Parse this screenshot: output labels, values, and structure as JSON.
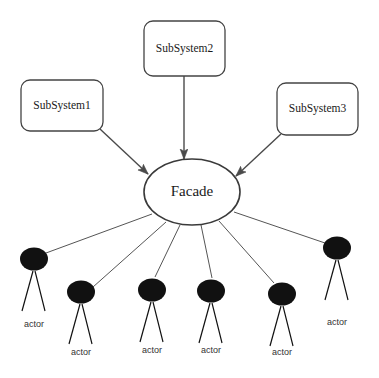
{
  "diagram": {
    "type": "uml-facade",
    "canvas": {
      "width": 379,
      "height": 378,
      "background": "#ffffff"
    },
    "colors": {
      "box_stroke": "#444444",
      "box_fill": "#ffffff",
      "ellipse_stroke": "#3a3a3a",
      "ellipse_fill": "#ffffff",
      "arrow": "#4a4a4a",
      "association": "#555555",
      "actor": "#111111",
      "text": "#1a1a1a"
    },
    "subsystems": [
      {
        "id": "subsystem1",
        "label": "SubSystem1",
        "x": 21,
        "y": 80,
        "w": 82,
        "h": 51
      },
      {
        "id": "subsystem2",
        "label": "SubSystem2",
        "x": 144,
        "y": 21,
        "w": 81,
        "h": 55
      },
      {
        "id": "subsystem3",
        "label": "SubSystem3",
        "x": 277,
        "y": 83,
        "w": 81,
        "h": 52
      }
    ],
    "facade": {
      "id": "facade",
      "label": "Facade",
      "cx": 192,
      "cy": 192,
      "rx": 48,
      "ry": 33
    },
    "actors": [
      {
        "id": "actor1",
        "label": "actor",
        "cx": 34,
        "cy": 259,
        "r": 13,
        "label_y": 325
      },
      {
        "id": "actor2",
        "label": "actor",
        "cx": 81,
        "cy": 292,
        "r": 13,
        "label_y": 353
      },
      {
        "id": "actor3",
        "label": "actor",
        "cx": 152,
        "cy": 290,
        "r": 13,
        "label_y": 351
      },
      {
        "id": "actor4",
        "label": "actor",
        "cx": 211,
        "cy": 291,
        "r": 13,
        "label_y": 351
      },
      {
        "id": "actor5",
        "label": "actor",
        "cx": 282,
        "cy": 294,
        "r": 13,
        "label_y": 353
      },
      {
        "id": "actor6",
        "label": "actor",
        "cx": 337,
        "cy": 248,
        "r": 13,
        "label_y": 323
      }
    ],
    "arrows": [
      {
        "id": "arrow-subsystem1-facade",
        "from": "subsystem1",
        "to": "facade",
        "x1": 100,
        "y1": 129,
        "x2": 148,
        "y2": 174
      },
      {
        "id": "arrow-subsystem2-facade",
        "from": "subsystem2",
        "to": "facade",
        "x1": 184,
        "y1": 76,
        "x2": 184,
        "y2": 159
      },
      {
        "id": "arrow-subsystem3-facade",
        "from": "subsystem3",
        "to": "facade",
        "x1": 281,
        "y1": 134,
        "x2": 236,
        "y2": 176
      }
    ],
    "associations": [
      {
        "id": "assoc-facade-actor1",
        "from": "facade",
        "to": "actor1",
        "x1": 152,
        "y1": 214,
        "x2": 46,
        "y2": 253
      },
      {
        "id": "assoc-facade-actor2",
        "from": "facade",
        "to": "actor2",
        "x1": 166,
        "y1": 222,
        "x2": 93,
        "y2": 287
      },
      {
        "id": "assoc-facade-actor3",
        "from": "facade",
        "to": "actor3",
        "x1": 180,
        "y1": 225,
        "x2": 155,
        "y2": 277
      },
      {
        "id": "assoc-facade-actor4",
        "from": "facade",
        "to": "actor4",
        "x1": 201,
        "y1": 225,
        "x2": 212,
        "y2": 278
      },
      {
        "id": "assoc-facade-actor5",
        "from": "facade",
        "to": "actor5",
        "x1": 219,
        "y1": 221,
        "x2": 274,
        "y2": 283
      },
      {
        "id": "assoc-facade-actor6",
        "from": "facade",
        "to": "actor6",
        "x1": 234,
        "y1": 212,
        "x2": 325,
        "y2": 243
      }
    ]
  }
}
